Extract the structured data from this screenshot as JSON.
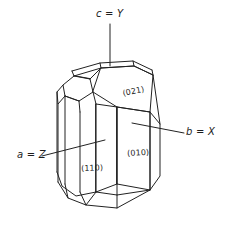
{
  "figure": {
    "background_color": "#ffffff",
    "line_color": "#222222"
  },
  "axes": [
    {
      "id": "c-y",
      "label": "c = Y",
      "crystal_axis": "c",
      "optical_axis": "Y",
      "equals": "=",
      "direction": "vertical-top",
      "leader": "vertical line from label down to top termination of crystal"
    },
    {
      "id": "b-x",
      "label": "b = X",
      "crystal_axis": "b",
      "optical_axis": "X",
      "equals": "=",
      "direction": "right",
      "leader": "horizontal line from label left to the (010) face"
    },
    {
      "id": "a-z",
      "label": "a = Z",
      "crystal_axis": "a",
      "optical_axis": "Z",
      "equals": "=",
      "direction": "left",
      "leader": "line sloping up-right from label into the left prism faces"
    }
  ],
  "faces": [
    {
      "id": "face-021",
      "label": "(021)",
      "miller_index": "021",
      "position": "upper right pyramid face"
    },
    {
      "id": "face-010",
      "label": "(010)",
      "miller_index": "010",
      "position": "right prism face"
    },
    {
      "id": "face-110",
      "label": "(110)",
      "miller_index": "110",
      "position": "front left prism face"
    }
  ]
}
